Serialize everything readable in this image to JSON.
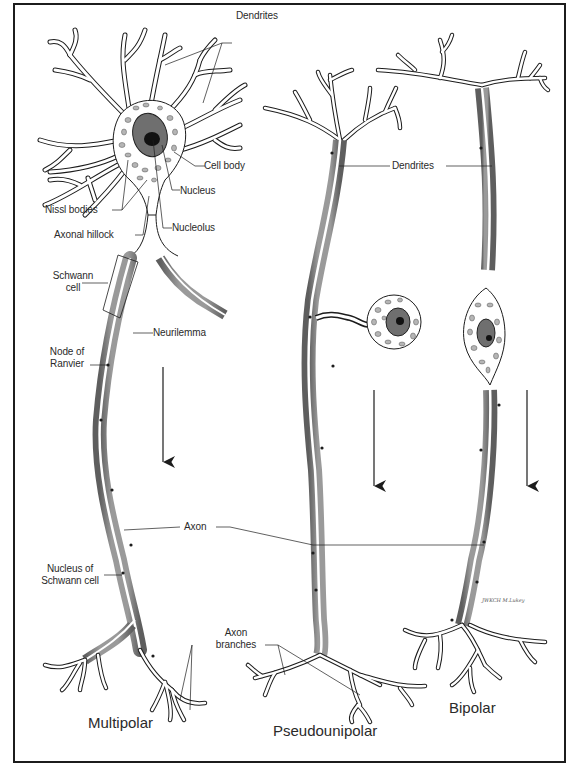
{
  "figure": {
    "neuron_types": [
      {
        "name": "Multipolar"
      },
      {
        "name": "Pseudounipolar"
      },
      {
        "name": "Bipolar"
      }
    ],
    "labels": {
      "dendrites_top": "Dendrites",
      "cell_body": "Cell body",
      "nucleus": "Nucleus",
      "nissl_bodies": "Nissl bodies",
      "nucleolus": "Nucleolus",
      "axonal_hillock": "Axonal hillock",
      "schwann_cell_line1": "Schwann",
      "schwann_cell_line2": "cell",
      "neurilemma": "Neurilemma",
      "node_of_ranvier_line1": "Node of",
      "node_of_ranvier_line2": "Ranvier",
      "dendrites_mid": "Dendrites",
      "axon": "Axon",
      "nucleus_schwann_line1": "Nucleus of",
      "nucleus_schwann_line2": "Schwann cell",
      "axon_branches_line1": "Axon",
      "axon_branches_line2": "branches"
    },
    "titles": {
      "multipolar": "Multipolar",
      "pseudounipolar": "Pseudounipolar",
      "bipolar": "Bipolar"
    },
    "signal_arrows": 3,
    "artist_signature": "JWKCH M.Lukey",
    "colors": {
      "ink": "#1c1c1c",
      "myelin": "#8a8a8a",
      "myelin_dark": "#5e5e5e",
      "nucleus": "#6f6f6f",
      "nucleolus": "#111111",
      "nissl": "#b5b5b5",
      "background": "#ffffff"
    }
  }
}
